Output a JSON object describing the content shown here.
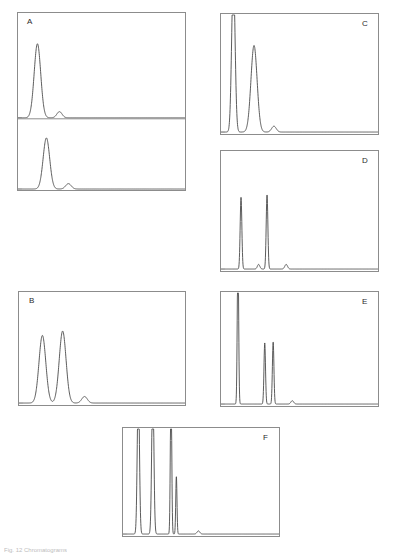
{
  "figure": {
    "caption": "Fig. 12  Chromatograms",
    "panel_count": 6,
    "stroke_color": "#4a4a4a",
    "frame_color": "#8c8c8c"
  },
  "panels": {
    "a": {
      "label": "A",
      "label_position": "top-left",
      "subpanel_count": 2
    },
    "b": {
      "label": "B",
      "label_position": "top-left",
      "subpanel_count": 1
    },
    "c": {
      "label": "C",
      "label_position": "top-right",
      "subpanel_count": 1
    },
    "d": {
      "label": "D",
      "label_position": "top-right",
      "subpanel_count": 1
    },
    "e": {
      "label": "E",
      "label_position": "top-right",
      "subpanel_count": 1
    },
    "f": {
      "label": "F",
      "label_position": "top-right",
      "subpanel_count": 1
    }
  },
  "chart_data": [
    {
      "id": "A-upper",
      "type": "line",
      "title": "A",
      "xlabel": "",
      "ylabel": "",
      "xlim": [
        0,
        100
      ],
      "ylim": [
        0,
        100
      ],
      "grid": false,
      "legend": "none",
      "peaks": [
        {
          "center": 9.5,
          "height": 72,
          "width": 4.0,
          "clipped": false
        },
        {
          "center": 23.0,
          "height": 6,
          "width": 3.2,
          "clipped": false
        }
      ]
    },
    {
      "id": "A-lower",
      "type": "line",
      "title": "A",
      "xlabel": "",
      "ylabel": "",
      "xlim": [
        0,
        100
      ],
      "ylim": [
        0,
        100
      ],
      "grid": false,
      "legend": "none",
      "peaks": [
        {
          "center": 15.0,
          "height": 76,
          "width": 4.0,
          "clipped": false
        },
        {
          "center": 28.5,
          "height": 8,
          "width": 3.4,
          "clipped": false
        }
      ]
    },
    {
      "id": "B",
      "type": "line",
      "title": "B",
      "xlabel": "",
      "ylabel": "",
      "xlim": [
        0,
        100
      ],
      "ylim": [
        0,
        100
      ],
      "grid": false,
      "legend": "none",
      "peaks": [
        {
          "center": 12.0,
          "height": 62,
          "width": 4.2,
          "clipped": false
        },
        {
          "center": 24.5,
          "height": 66,
          "width": 4.2,
          "clipped": false
        },
        {
          "center": 38.0,
          "height": 6,
          "width": 3.4,
          "clipped": false
        }
      ]
    },
    {
      "id": "C",
      "type": "line",
      "title": "C",
      "xlabel": "",
      "ylabel": "",
      "xlim": [
        0,
        100
      ],
      "ylim": [
        0,
        100
      ],
      "grid": false,
      "legend": "none",
      "peaks": [
        {
          "center": 5.5,
          "height": 135,
          "width": 2.2,
          "clipped": true
        },
        {
          "center": 19.0,
          "height": 74,
          "width": 4.0,
          "clipped": false
        },
        {
          "center": 32.0,
          "height": 5,
          "width": 3.0,
          "clipped": false
        }
      ]
    },
    {
      "id": "D",
      "type": "line",
      "title": "D",
      "xlabel": "",
      "ylabel": "",
      "xlim": [
        0,
        100
      ],
      "ylim": [
        0,
        100
      ],
      "grid": false,
      "legend": "none",
      "peaks": [
        {
          "center": 10.5,
          "height": 62,
          "width": 1.1,
          "clipped": false
        },
        {
          "center": 22.0,
          "height": 4,
          "width": 1.6,
          "clipped": false
        },
        {
          "center": 27.5,
          "height": 64,
          "width": 1.1,
          "clipped": false
        },
        {
          "center": 40.0,
          "height": 4,
          "width": 1.8,
          "clipped": false
        }
      ]
    },
    {
      "id": "E",
      "type": "line",
      "title": "E",
      "xlabel": "",
      "ylabel": "",
      "xlim": [
        0,
        100
      ],
      "ylim": [
        0,
        100
      ],
      "grid": false,
      "legend": "none",
      "peaks": [
        {
          "center": 8.5,
          "height": 140,
          "width": 0.9,
          "clipped": true
        },
        {
          "center": 26.0,
          "height": 55,
          "width": 1.0,
          "clipped": false
        },
        {
          "center": 31.5,
          "height": 56,
          "width": 1.0,
          "clipped": false
        },
        {
          "center": 44.0,
          "height": 3,
          "width": 1.8,
          "clipped": false
        }
      ]
    },
    {
      "id": "F",
      "type": "line",
      "title": "F",
      "xlabel": "",
      "ylabel": "",
      "xlim": [
        0,
        100
      ],
      "ylim": [
        0,
        100
      ],
      "grid": false,
      "legend": "none",
      "peaks": [
        {
          "center": 7.5,
          "height": 145,
          "width": 1.4,
          "clipped": true
        },
        {
          "center": 17.0,
          "height": 145,
          "width": 1.4,
          "clipped": true
        },
        {
          "center": 29.0,
          "height": 145,
          "width": 0.9,
          "clipped": true
        },
        {
          "center": 32.5,
          "height": 55,
          "width": 0.8,
          "clipped": false
        },
        {
          "center": 47.0,
          "height": 3,
          "width": 1.8,
          "clipped": false
        }
      ]
    }
  ]
}
